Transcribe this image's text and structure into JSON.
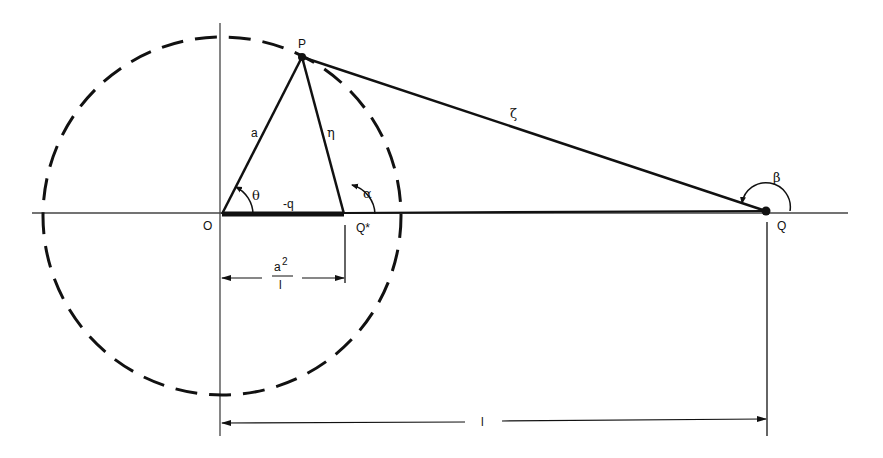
{
  "diagram": {
    "colors": {
      "ink": "#111111",
      "axis": "#444444",
      "background": "#ffffff"
    },
    "points": {
      "O": {
        "label": "O",
        "x": 222,
        "y": 214
      },
      "P": {
        "label": "P",
        "x": 302,
        "y": 57
      },
      "Qstar": {
        "label": "Q*",
        "x": 344,
        "y": 214
      },
      "Q": {
        "label": "Q",
        "x": 766,
        "y": 211
      }
    },
    "circle": {
      "cx": 222,
      "cy": 216,
      "r": 179,
      "style": "dashed"
    },
    "segments": {
      "OP": {
        "label": "a"
      },
      "QstarP": {
        "label": "η"
      },
      "PQ": {
        "label": "ζ"
      },
      "OQstar": {
        "label": "-q"
      }
    },
    "angles": {
      "theta": {
        "label": "θ"
      },
      "alpha": {
        "label": "α"
      },
      "beta": {
        "label": "β"
      }
    },
    "dimensions": {
      "image_distance": {
        "numerator": "a",
        "exponent": "2",
        "denominator": "l"
      },
      "charge_distance": {
        "label": "l"
      }
    }
  }
}
